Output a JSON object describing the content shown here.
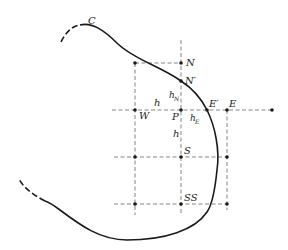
{
  "diagram": {
    "curve_label": "C",
    "points": [
      {
        "id": "N",
        "label": "N",
        "x": 181,
        "y": 63
      },
      {
        "id": "N_prime",
        "label": "N′",
        "x": 181,
        "y": 81
      },
      {
        "id": "W",
        "label": "W",
        "x": 135,
        "y": 110
      },
      {
        "id": "P",
        "label": "P",
        "x": 181,
        "y": 110
      },
      {
        "id": "E_prime",
        "label": "E′",
        "x": 207,
        "y": 110
      },
      {
        "id": "E",
        "label": "E",
        "x": 227,
        "y": 110
      },
      {
        "id": "S",
        "label": "S",
        "x": 181,
        "y": 157
      },
      {
        "id": "SS",
        "label": "SS",
        "x": 181,
        "y": 204
      }
    ],
    "spacing_labels": {
      "h_horizontal": "h",
      "h_vertical": "h",
      "h_N_main": "h",
      "h_N_sub": "N",
      "h_E_main": "h",
      "h_E_sub": "E"
    },
    "colors": {
      "curve": "#1a1a1a",
      "grid": "#777777",
      "text": "#222222"
    }
  }
}
